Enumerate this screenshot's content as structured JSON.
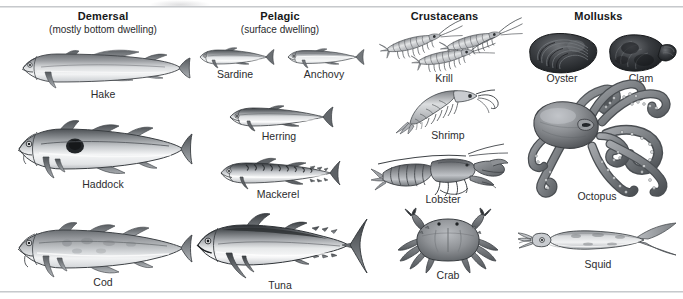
{
  "figure": {
    "kind": "seafood-categories-illustration",
    "background": "#ffffff",
    "rule_color": "#b9bcc0",
    "label_color": "#2b2c2e"
  },
  "columns": [
    {
      "key": "demersal",
      "title": "Demersal",
      "subtitle": "(mostly bottom dwelling)",
      "items": [
        {
          "key": "hake",
          "label": "Hake"
        },
        {
          "key": "haddock",
          "label": "Haddock"
        },
        {
          "key": "cod",
          "label": "Cod"
        }
      ]
    },
    {
      "key": "pelagic",
      "title": "Pelagic",
      "subtitle": "(surface dwelling)",
      "items": [
        {
          "key": "sardine",
          "label": "Sardine"
        },
        {
          "key": "anchovy",
          "label": "Anchovy"
        },
        {
          "key": "herring",
          "label": "Herring"
        },
        {
          "key": "mackerel",
          "label": "Mackerel"
        },
        {
          "key": "tuna",
          "label": "Tuna"
        }
      ]
    },
    {
      "key": "crustaceans",
      "title": "Crustaceans",
      "subtitle": "",
      "items": [
        {
          "key": "krill",
          "label": "Krill"
        },
        {
          "key": "shrimp",
          "label": "Shrimp"
        },
        {
          "key": "lobster",
          "label": "Lobster"
        },
        {
          "key": "crab",
          "label": "Crab"
        }
      ]
    },
    {
      "key": "mollusks",
      "title": "Mollusks",
      "subtitle": "",
      "items": [
        {
          "key": "oyster",
          "label": "Oyster"
        },
        {
          "key": "clam",
          "label": "Clam"
        },
        {
          "key": "octopus",
          "label": "Octopus"
        },
        {
          "key": "squid",
          "label": "Squid"
        }
      ]
    }
  ]
}
